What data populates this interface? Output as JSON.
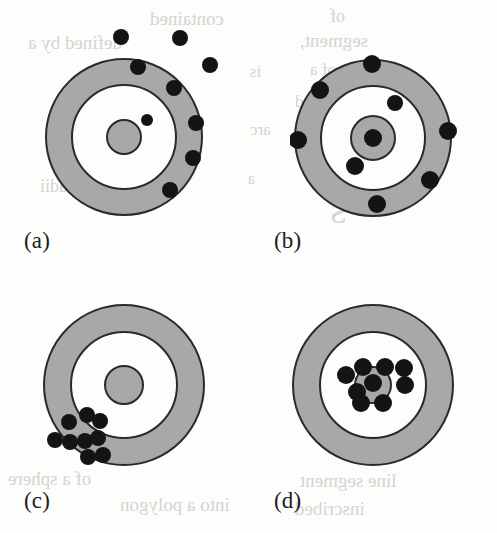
{
  "figure": {
    "background_color": "#fdfdfc",
    "ring_fill_color": "#a8a8a8",
    "ring_gap_color": "#fdfdfc",
    "ring_stroke_color": "#2a2a2a",
    "shot_color": "#141414",
    "panel_count": 4
  },
  "ghost_text": [
    {
      "text": "contained",
      "x": 150,
      "y": 8,
      "size": 19
    },
    {
      "text": "of",
      "x": 330,
      "y": 6,
      "size": 18
    },
    {
      "text": "defined by a",
      "x": 28,
      "y": 32,
      "size": 19
    },
    {
      "text": "segment,",
      "x": 300,
      "y": 30,
      "size": 19
    },
    {
      "text": "is",
      "x": 250,
      "y": 62,
      "size": 17
    },
    {
      "text": "of a",
      "x": 310,
      "y": 60,
      "size": 17
    },
    {
      "text": "considered",
      "x": 295,
      "y": 92,
      "size": 17
    },
    {
      "text": "arc",
      "x": 250,
      "y": 120,
      "size": 17
    },
    {
      "text": "of",
      "x": 300,
      "y": 148,
      "size": 17
    },
    {
      "text": "a",
      "x": 248,
      "y": 170,
      "size": 16
    },
    {
      "text": "radii",
      "x": 40,
      "y": 176,
      "size": 18
    },
    {
      "text": "S",
      "x": 330,
      "y": 196,
      "size": 30
    },
    {
      "text": "of a sphere",
      "x": 8,
      "y": 468,
      "size": 19
    },
    {
      "text": "into a polygon",
      "x": 120,
      "y": 494,
      "size": 19
    },
    {
      "text": "line segment",
      "x": 300,
      "y": 470,
      "size": 19
    },
    {
      "text": "inscribed",
      "x": 295,
      "y": 498,
      "size": 19
    }
  ],
  "panels": [
    {
      "id": "panel-a",
      "label": "(a)",
      "label_x": 24,
      "label_y": 228,
      "box": {
        "x": 38,
        "y": 10,
        "w": 180,
        "h": 215
      },
      "center": {
        "cx": 86,
        "cy": 127
      },
      "radii": {
        "outer": 78,
        "middle": 52,
        "inner": 17
      },
      "description": "low accuracy, low precision - shots scattered high and right, mostly outside the target",
      "shots": [
        {
          "x": 83,
          "y": 27,
          "r": 8
        },
        {
          "x": 142,
          "y": 28,
          "r": 8
        },
        {
          "x": 100,
          "y": 57,
          "r": 8
        },
        {
          "x": 172,
          "y": 55,
          "r": 8
        },
        {
          "x": 136,
          "y": 78,
          "r": 8
        },
        {
          "x": 109,
          "y": 110,
          "r": 6
        },
        {
          "x": 158,
          "y": 113,
          "r": 8
        },
        {
          "x": 155,
          "y": 148,
          "r": 8
        },
        {
          "x": 132,
          "y": 180,
          "r": 8
        }
      ]
    },
    {
      "id": "panel-b",
      "label": "(b)",
      "label_x": 274,
      "label_y": 228,
      "box": {
        "x": 290,
        "y": 10,
        "w": 180,
        "h": 215
      },
      "center": {
        "cx": 83,
        "cy": 128
      },
      "radii": {
        "outer": 78,
        "middle": 52,
        "inner": 22
      },
      "description": "high accuracy, low precision - shots spread all around but centered on the bullseye",
      "shots": [
        {
          "x": 82,
          "y": 54,
          "r": 9
        },
        {
          "x": 30,
          "y": 80,
          "r": 9
        },
        {
          "x": 105,
          "y": 93,
          "r": 8
        },
        {
          "x": 83,
          "y": 128,
          "r": 9
        },
        {
          "x": 65,
          "y": 156,
          "r": 9
        },
        {
          "x": 8,
          "y": 130,
          "r": 9
        },
        {
          "x": 158,
          "y": 121,
          "r": 9
        },
        {
          "x": 140,
          "y": 170,
          "r": 9
        },
        {
          "x": 87,
          "y": 194,
          "r": 9
        }
      ]
    },
    {
      "id": "panel-c",
      "label": "(c)",
      "label_x": 24,
      "label_y": 488,
      "box": {
        "x": 40,
        "y": 295,
        "w": 180,
        "h": 190
      },
      "center": {
        "cx": 84,
        "cy": 90
      },
      "radii": {
        "outer": 80,
        "middle": 53,
        "inner": 19
      },
      "description": "low accuracy, high precision - tight cluster low and left of the bullseye",
      "shots": [
        {
          "x": 29,
          "y": 127,
          "r": 8
        },
        {
          "x": 47,
          "y": 120,
          "r": 8
        },
        {
          "x": 60,
          "y": 126,
          "r": 8
        },
        {
          "x": 15,
          "y": 145,
          "r": 8
        },
        {
          "x": 30,
          "y": 147,
          "r": 8
        },
        {
          "x": 45,
          "y": 146,
          "r": 8
        },
        {
          "x": 58,
          "y": 143,
          "r": 8
        },
        {
          "x": 48,
          "y": 162,
          "r": 8
        },
        {
          "x": 63,
          "y": 160,
          "r": 8
        }
      ]
    },
    {
      "id": "panel-d",
      "label": "(d)",
      "label_x": 274,
      "label_y": 488,
      "box": {
        "x": 290,
        "y": 295,
        "w": 180,
        "h": 190
      },
      "center": {
        "cx": 83,
        "cy": 90
      },
      "radii": {
        "outer": 80,
        "middle": 53,
        "inner": 18
      },
      "description": "high accuracy, high precision - tight cluster on the bullseye",
      "shots": [
        {
          "x": 73,
          "y": 72,
          "r": 9
        },
        {
          "x": 95,
          "y": 72,
          "r": 9
        },
        {
          "x": 114,
          "y": 73,
          "r": 9
        },
        {
          "x": 56,
          "y": 80,
          "r": 9
        },
        {
          "x": 83,
          "y": 88,
          "r": 9
        },
        {
          "x": 67,
          "y": 97,
          "r": 9
        },
        {
          "x": 115,
          "y": 90,
          "r": 9
        },
        {
          "x": 71,
          "y": 108,
          "r": 9
        },
        {
          "x": 93,
          "y": 108,
          "r": 9
        }
      ]
    }
  ]
}
